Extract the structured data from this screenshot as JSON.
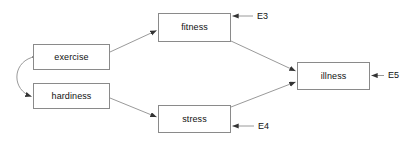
{
  "diagram": {
    "type": "sem-path-diagram",
    "background_color": "#ffffff",
    "box_border_color": "#8a8a8a",
    "line_color": "#9a9a9a",
    "text_color": "#111111",
    "nodes": [
      {
        "id": "exercise",
        "label": "exercise",
        "x": 33,
        "y": 44,
        "w": 77,
        "h": 26
      },
      {
        "id": "hardiness",
        "label": "hardiness",
        "x": 33,
        "y": 83,
        "w": 77,
        "h": 26
      },
      {
        "id": "fitness",
        "label": "fitness",
        "x": 158,
        "y": 13,
        "w": 73,
        "h": 29
      },
      {
        "id": "stress",
        "label": "stress",
        "x": 158,
        "y": 105,
        "w": 73,
        "h": 28
      },
      {
        "id": "illness",
        "label": "illness",
        "x": 297,
        "y": 62,
        "w": 73,
        "h": 28
      }
    ],
    "errors": [
      {
        "id": "e3",
        "label": "E3",
        "target": "fitness",
        "x": 257,
        "y": 12
      },
      {
        "id": "e4",
        "label": "E4",
        "target": "stress",
        "x": 258,
        "y": 122
      },
      {
        "id": "e5",
        "label": "E5",
        "target": "illness",
        "x": 388,
        "y": 71
      }
    ],
    "paths": [
      {
        "id": "exercise-to-fitness",
        "from": "exercise",
        "to": "fitness",
        "style": "directed"
      },
      {
        "id": "hardiness-to-stress",
        "from": "hardiness",
        "to": "stress",
        "style": "directed"
      },
      {
        "id": "fitness-to-illness",
        "from": "fitness",
        "to": "illness",
        "style": "directed"
      },
      {
        "id": "stress-to-illness",
        "from": "stress",
        "to": "illness",
        "style": "directed"
      },
      {
        "id": "exercise-hardiness-correlation",
        "from": "exercise",
        "to": "hardiness",
        "style": "curved-bidirectional"
      },
      {
        "id": "e3-to-fitness",
        "from": "E3",
        "to": "fitness",
        "style": "directed"
      },
      {
        "id": "e4-to-stress",
        "from": "E4",
        "to": "stress",
        "style": "directed"
      },
      {
        "id": "e5-to-illness",
        "from": "E5",
        "to": "illness",
        "style": "directed"
      }
    ]
  }
}
